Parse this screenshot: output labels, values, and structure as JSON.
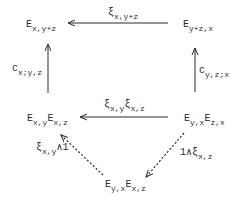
{
  "diagram": {
    "type": "commutative-diagram",
    "nodes": {
      "top_left": {
        "base": "E",
        "sub": "x,y+z"
      },
      "top_right": {
        "base": "E",
        "sub": "y+z,x"
      },
      "mid_left": {
        "base1": "E",
        "sub1": "x,y",
        "base2": "E",
        "sub2": "x,z"
      },
      "mid_right": {
        "base1": "E",
        "sub1": "y,x",
        "base2": "E",
        "sub2": "z,x"
      },
      "bottom": {
        "base1": "E",
        "sub1": "y,x",
        "base2": "E",
        "sub2": "x,z"
      }
    },
    "arrows": {
      "top": {
        "from": "top_right",
        "to": "top_left",
        "base": "ξ",
        "sub": "x,y+z",
        "style": "solid"
      },
      "middle": {
        "from": "mid_right",
        "to": "mid_left",
        "base1": "ξ",
        "sub1": "x,y",
        "base2": "ξ",
        "sub2": "x,z",
        "style": "solid"
      },
      "left_vert": {
        "from": "mid_left",
        "to": "top_left",
        "base": "c",
        "sub": "x;y,z",
        "style": "solid"
      },
      "right_vert": {
        "from": "mid_right",
        "to": "top_right",
        "base": "c",
        "sub": "y,z;x",
        "style": "solid"
      },
      "left_diag": {
        "from": "bottom",
        "to": "mid_left",
        "base": "ξ",
        "sub": "x,y",
        "suffix": "∧1",
        "style": "dashed"
      },
      "right_diag": {
        "from": "mid_right",
        "to": "bottom",
        "prefix": "1∧",
        "base": "ξ",
        "sub": "x,z",
        "style": "dashed"
      }
    }
  }
}
